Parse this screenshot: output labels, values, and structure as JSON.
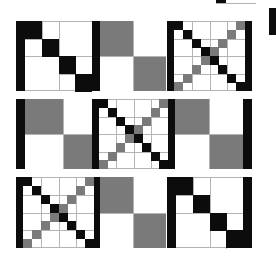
{
  "colors": {
    "black": "#0c0c0c",
    "grey": "#7a7a7a",
    "white": "#ffffff",
    "line": "#b4b4b4"
  },
  "figure": {
    "rows": [
      {
        "panels": [
          "N-diagonal",
          "checker",
          "X-diagonal"
        ]
      },
      {
        "panels": [
          "checker",
          "X-diagonal",
          "checker"
        ]
      },
      {
        "panels": [
          "X-diagonal",
          "checker",
          "N-diagonal"
        ]
      }
    ]
  },
  "corner_fragment": {
    "visible": true
  }
}
